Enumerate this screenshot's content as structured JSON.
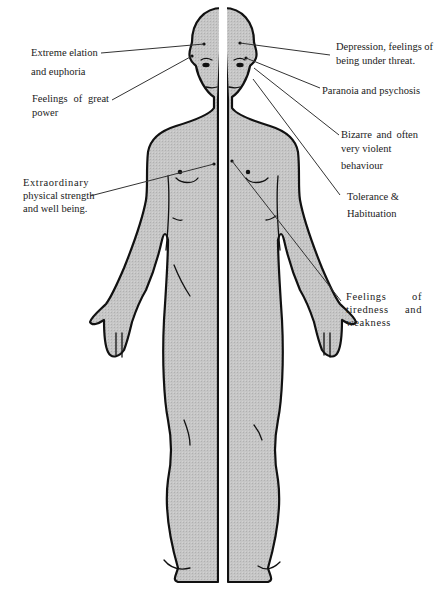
{
  "diagram": {
    "type": "body-effects-diagram",
    "colors": {
      "background": "#ffffff",
      "body_fill": "#c4c4c4",
      "outline": "#111111",
      "divider": "#ffffff",
      "leader_line": "#333333",
      "text": "#1a1a1a"
    },
    "left_side_labels": [
      {
        "id": "elation",
        "lines": [
          "Extreme elation",
          "and euphoria"
        ]
      },
      {
        "id": "power",
        "lines": [
          "Feelings  of  great",
          "power"
        ]
      },
      {
        "id": "strength",
        "lines": [
          "Extraordinary",
          "physical strength",
          "and well being."
        ]
      }
    ],
    "right_side_labels": [
      {
        "id": "depression",
        "lines": [
          "Depression, feelings of",
          "being under threat."
        ]
      },
      {
        "id": "paranoia",
        "lines": [
          "Paranoia and psychosis"
        ]
      },
      {
        "id": "bizarre",
        "lines": [
          "Bizarre   and   often",
          "very violent",
          "behaviour"
        ]
      },
      {
        "id": "tolerance",
        "lines": [
          "Tolerance &",
          "Habituation"
        ]
      },
      {
        "id": "tiredness",
        "lines": [
          "Feelings    of",
          "tiredness   and",
          "weakness"
        ]
      }
    ]
  }
}
